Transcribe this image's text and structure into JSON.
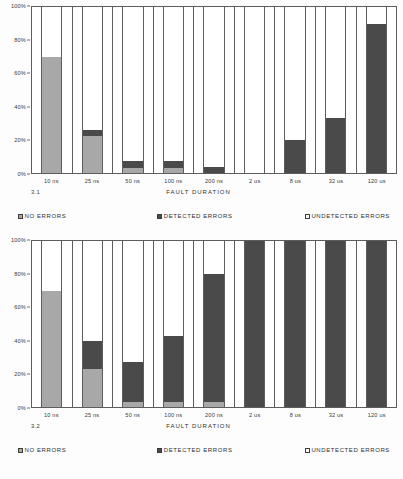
{
  "colors": {
    "no_errors": "#a8a8a8",
    "detected_errors": "#4a4a4a",
    "undetected_errors": "#ffffff",
    "axis": "#5d5d5d",
    "text": "#2f2f2f"
  },
  "figures": [
    {
      "id": "3.1",
      "number_label": "3.1",
      "axis_title": "FAULT DURATION",
      "y_ticks": [
        "100%",
        "80%",
        "60%",
        "40%",
        "20%",
        "0%"
      ],
      "legend": [
        {
          "label": "NO ERRORS",
          "swatch": "no-errors-swatch"
        },
        {
          "label": "DETECTED ERRORS",
          "swatch": "detected-errors-swatch"
        },
        {
          "label": "UNDETECTED ERRORS",
          "swatch": "undetected-errors-swatch"
        }
      ]
    },
    {
      "id": "3.2",
      "number_label": "3.2",
      "axis_title": "FAULT DURATION",
      "y_ticks": [
        "100%",
        "80%",
        "60%",
        "40%",
        "20%",
        "0%"
      ],
      "legend": [
        {
          "label": "NO ERRORS",
          "swatch": "no-errors-swatch"
        },
        {
          "label": "DETECTED ERRORS",
          "swatch": "detected-errors-swatch"
        },
        {
          "label": "UNDETECTED ERRORS",
          "swatch": "undetected-errors-swatch"
        }
      ]
    }
  ],
  "chart_data": [
    {
      "type": "bar",
      "title": "3.1",
      "stacked": true,
      "percent": true,
      "xlabel": "FAULT DURATION",
      "ylabel": "",
      "ylim": [
        0,
        100
      ],
      "yticks": [
        0,
        20,
        40,
        60,
        80,
        100
      ],
      "ytick_labels": [
        "0%",
        "20%",
        "40%",
        "60%",
        "80%",
        "100%"
      ],
      "grid": false,
      "legend_position": "bottom",
      "categories": [
        "10 ns",
        "25 ns",
        "50 ns",
        "100 ns",
        "200 ns",
        "2 us",
        "8 us",
        "32 us",
        "120 us"
      ],
      "series": [
        {
          "name": "NO ERRORS",
          "values": [
            70,
            22,
            3,
            3,
            0,
            0,
            0,
            0,
            0
          ]
        },
        {
          "name": "DETECTED ERRORS",
          "values": [
            0,
            4,
            4,
            4,
            3.5,
            0,
            20,
            33,
            90
          ]
        },
        {
          "name": "UNDETECTED ERRORS",
          "values": [
            30,
            74,
            93,
            93,
            96.5,
            100,
            80,
            67,
            10
          ]
        }
      ]
    },
    {
      "type": "bar",
      "title": "3.2",
      "stacked": true,
      "percent": true,
      "xlabel": "FAULT DURATION",
      "ylabel": "",
      "ylim": [
        0,
        100
      ],
      "yticks": [
        0,
        20,
        40,
        60,
        80,
        100
      ],
      "ytick_labels": [
        "0%",
        "20%",
        "40%",
        "60%",
        "80%",
        "100%"
      ],
      "grid": false,
      "legend_position": "bottom",
      "categories": [
        "10 ns",
        "25 ns",
        "50 ns",
        "100 ns",
        "200 ns",
        "2 us",
        "8 us",
        "32 us",
        "120 us"
      ],
      "series": [
        {
          "name": "NO ERRORS",
          "values": [
            70,
            23,
            3,
            3,
            3,
            0,
            0,
            0,
            0
          ]
        },
        {
          "name": "DETECTED ERRORS",
          "values": [
            0,
            17,
            24,
            40,
            77,
            100,
            100,
            100,
            100
          ]
        },
        {
          "name": "UNDETECTED ERRORS",
          "values": [
            30,
            60,
            73,
            57,
            20,
            0,
            0,
            0,
            0
          ]
        }
      ]
    }
  ]
}
